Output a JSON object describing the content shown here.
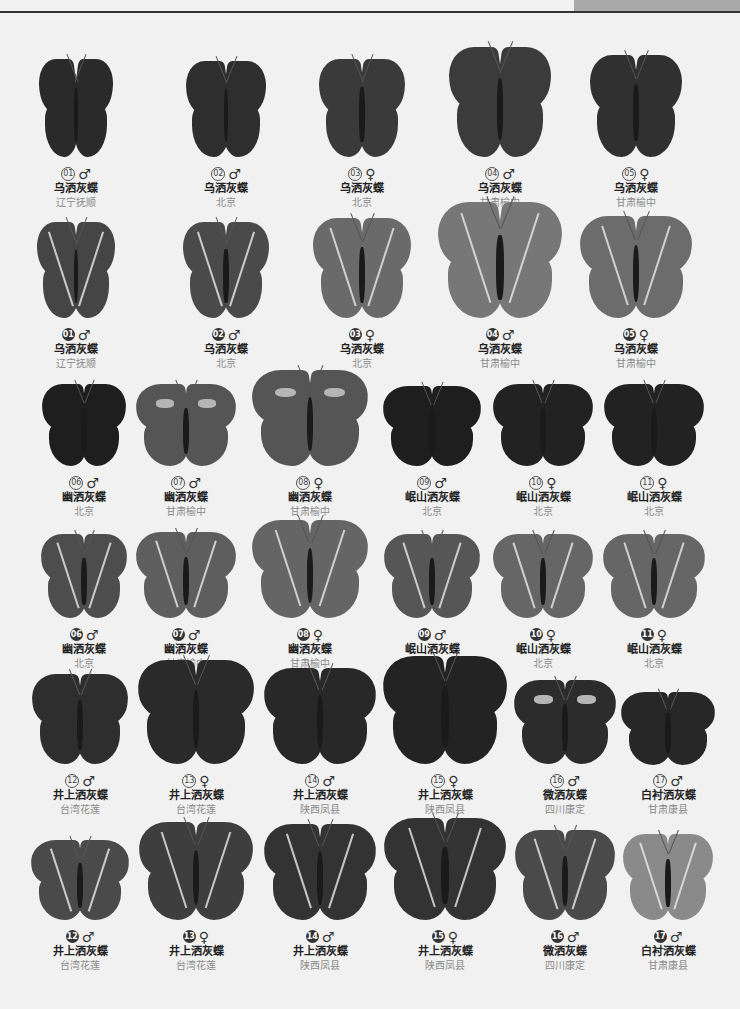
{
  "page": {
    "header_tab_color": "#a9a9a9",
    "header_line_color": "#333333",
    "background": "#f1f1f1"
  },
  "rows": [
    {
      "y": 58,
      "label_y": 167,
      "style": "outline",
      "view": "upperside",
      "specimens": [
        {
          "cx": 76,
          "w": 74,
          "h": 100,
          "num": "01",
          "sex": "♂",
          "name": "乌洒灰蝶",
          "location": "辽宁抚顺",
          "tone": "#2a2a2a"
        },
        {
          "cx": 226,
          "w": 80,
          "h": 98,
          "num": "02",
          "sex": "♂",
          "name": "乌洒灰蝶",
          "location": "北京",
          "tone": "#2e2e2e"
        },
        {
          "cx": 362,
          "w": 86,
          "h": 100,
          "num": "03",
          "sex": "♀",
          "name": "乌洒灰蝶",
          "location": "北京",
          "tone": "#3a3a3a"
        },
        {
          "cx": 500,
          "w": 102,
          "h": 112,
          "num": "04",
          "sex": "♂",
          "name": "乌洒灰蝶",
          "location": "甘肃榆中",
          "tone": "#3b3b3b"
        },
        {
          "cx": 636,
          "w": 92,
          "h": 104,
          "num": "05",
          "sex": "♀",
          "name": "乌洒灰蝶",
          "location": "甘肃榆中",
          "tone": "#303030"
        }
      ]
    },
    {
      "y": 222,
      "label_y": 328,
      "style": "filled",
      "view": "underside",
      "specimens": [
        {
          "cx": 76,
          "w": 78,
          "h": 98,
          "num": "01",
          "sex": "♂",
          "name": "乌洒灰蝶",
          "location": "辽宁抚顺",
          "tone": "#454545"
        },
        {
          "cx": 226,
          "w": 86,
          "h": 98,
          "num": "02",
          "sex": "♂",
          "name": "乌洒灰蝶",
          "location": "北京",
          "tone": "#4a4a4a"
        },
        {
          "cx": 362,
          "w": 98,
          "h": 102,
          "num": "03",
          "sex": "♀",
          "name": "乌洒灰蝶",
          "location": "北京",
          "tone": "#6a6a6a"
        },
        {
          "cx": 500,
          "w": 124,
          "h": 118,
          "num": "04",
          "sex": "♂",
          "name": "乌洒灰蝶",
          "location": "甘肃榆中",
          "tone": "#777777"
        },
        {
          "cx": 636,
          "w": 112,
          "h": 104,
          "num": "05",
          "sex": "♀",
          "name": "乌洒灰蝶",
          "location": "甘肃榆中",
          "tone": "#6c6c6c"
        }
      ]
    },
    {
      "y": 376,
      "label_y": 476,
      "style": "outline",
      "view": "upperside",
      "specimens": [
        {
          "cx": 84,
          "w": 84,
          "h": 84,
          "num": "06",
          "sex": "♂",
          "name": "幽洒灰蝶",
          "location": "北京",
          "tone": "#1e1e1e"
        },
        {
          "cx": 186,
          "w": 100,
          "h": 84,
          "num": "07",
          "sex": "♂",
          "name": "幽洒灰蝶",
          "location": "甘肃榆中",
          "tone": "#555555",
          "patch": true
        },
        {
          "cx": 310,
          "w": 116,
          "h": 98,
          "num": "08",
          "sex": "♀",
          "name": "幽洒灰蝶",
          "location": "甘肃榆中",
          "tone": "#555555",
          "patch": true
        },
        {
          "cx": 432,
          "w": 98,
          "h": 82,
          "num": "09",
          "sex": "♂",
          "name": "岷山洒灰蝶",
          "location": "北京",
          "tone": "#1e1e1e"
        },
        {
          "cx": 543,
          "w": 100,
          "h": 84,
          "num": "10",
          "sex": "♀",
          "name": "岷山洒灰蝶",
          "location": "北京",
          "tone": "#222222"
        },
        {
          "cx": 654,
          "w": 100,
          "h": 84,
          "num": "11",
          "sex": "♀",
          "name": "岷山洒灰蝶",
          "location": "北京",
          "tone": "#222222"
        }
      ]
    },
    {
      "y": 530,
      "label_y": 628,
      "style": "filled",
      "view": "underside",
      "specimens": [
        {
          "cx": 84,
          "w": 86,
          "h": 86,
          "num": "06",
          "sex": "♂",
          "name": "幽洒灰蝶",
          "location": "北京",
          "tone": "#4d4d4d"
        },
        {
          "cx": 186,
          "w": 100,
          "h": 88,
          "num": "07",
          "sex": "♂",
          "name": "幽洒灰蝶",
          "location": "甘肃榆中",
          "tone": "#5e5e5e"
        },
        {
          "cx": 310,
          "w": 116,
          "h": 100,
          "num": "08",
          "sex": "♀",
          "name": "幽洒灰蝶",
          "location": "甘肃榆中",
          "tone": "#656565"
        },
        {
          "cx": 432,
          "w": 96,
          "h": 86,
          "num": "09",
          "sex": "♂",
          "name": "岷山洒灰蝶",
          "location": "北京",
          "tone": "#565656"
        },
        {
          "cx": 543,
          "w": 100,
          "h": 86,
          "num": "10",
          "sex": "♀",
          "name": "岷山洒灰蝶",
          "location": "北京",
          "tone": "#666666"
        },
        {
          "cx": 654,
          "w": 102,
          "h": 86,
          "num": "11",
          "sex": "♀",
          "name": "岷山洒灰蝶",
          "location": "北京",
          "tone": "#666666"
        }
      ]
    },
    {
      "y": 678,
      "label_y": 774,
      "style": "outline",
      "view": "upperside",
      "specimens": [
        {
          "cx": 80,
          "w": 96,
          "h": 92,
          "num": "12",
          "sex": "♂",
          "name": "井上洒灰蝶",
          "location": "台湾花莲",
          "tone": "#2e2e2e"
        },
        {
          "cx": 196,
          "w": 116,
          "h": 106,
          "num": "13",
          "sex": "♀",
          "name": "井上洒灰蝶",
          "location": "台湾花莲",
          "tone": "#2a2a2a"
        },
        {
          "cx": 320,
          "w": 112,
          "h": 98,
          "num": "14",
          "sex": "♂",
          "name": "井上洒灰蝶",
          "location": "陕西凤县",
          "tone": "#282828"
        },
        {
          "cx": 445,
          "w": 124,
          "h": 110,
          "num": "15",
          "sex": "♀",
          "name": "井上洒灰蝶",
          "location": "陕西凤县",
          "tone": "#232323"
        },
        {
          "cx": 565,
          "w": 102,
          "h": 86,
          "num": "16",
          "sex": "♂",
          "name": "微洒灰蝶",
          "location": "四川康定",
          "tone": "#2c2c2c",
          "patch": true
        },
        {
          "cx": 668,
          "w": 94,
          "h": 74,
          "num": "17",
          "sex": "♂",
          "name": "白衬洒灰蝶",
          "location": "甘肃康县",
          "tone": "#272727"
        }
      ]
    },
    {
      "y": 826,
      "label_y": 930,
      "style": "filled",
      "view": "underside",
      "specimens": [
        {
          "cx": 80,
          "w": 98,
          "h": 82,
          "num": "12",
          "sex": "♂",
          "name": "井上洒灰蝶",
          "location": "台湾花莲",
          "tone": "#4a4a4a"
        },
        {
          "cx": 196,
          "w": 114,
          "h": 100,
          "num": "13",
          "sex": "♀",
          "name": "井上洒灰蝶",
          "location": "台湾花莲",
          "tone": "#3e3e3e"
        },
        {
          "cx": 320,
          "w": 112,
          "h": 98,
          "num": "14",
          "sex": "♂",
          "name": "井上洒灰蝶",
          "location": "陕西凤县",
          "tone": "#333333"
        },
        {
          "cx": 445,
          "w": 122,
          "h": 104,
          "num": "15",
          "sex": "♀",
          "name": "井上洒灰蝶",
          "location": "陕西凤县",
          "tone": "#333333"
        },
        {
          "cx": 565,
          "w": 100,
          "h": 92,
          "num": "16",
          "sex": "♂",
          "name": "微洒灰蝶",
          "location": "四川康定",
          "tone": "#4a4a4a"
        },
        {
          "cx": 668,
          "w": 90,
          "h": 88,
          "num": "17",
          "sex": "♂",
          "name": "白衬洒灰蝶",
          "location": "甘肃康县",
          "tone": "#8a8a8a"
        }
      ]
    }
  ]
}
